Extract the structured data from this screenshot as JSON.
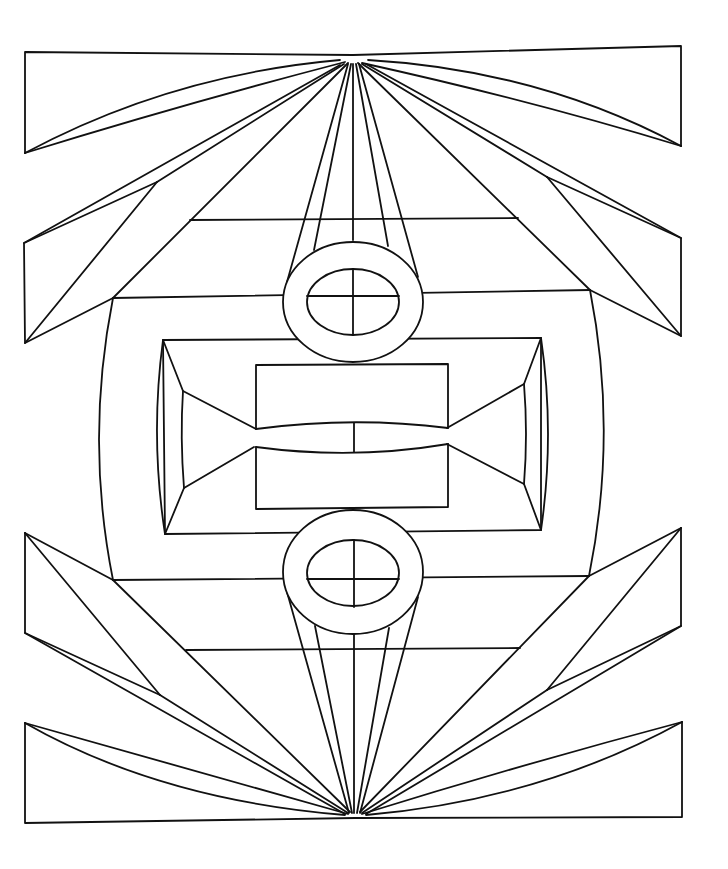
{
  "artwork": {
    "title": "",
    "stroke_color": "#111111",
    "background_color": "#ffffff",
    "width": 728,
    "height": 869,
    "apex_top": [
      353,
      55
    ],
    "apex_bottom": [
      355,
      818
    ],
    "paths": [
      {
        "name": "top-left-banner",
        "d": "M353,55 L25,52 L25,153"
      },
      {
        "name": "top-left-leaf-outer",
        "d": "M25,153 Q170,75 340,60"
      },
      {
        "name": "top-left-leaf-inner",
        "d": "M25,153 Q180,105 345,62"
      },
      {
        "name": "top-right-banner",
        "d": "M353,55 L681,46 L681,146"
      },
      {
        "name": "top-right-leaf-outer",
        "d": "M681,146 Q540,70 368,60"
      },
      {
        "name": "top-right-leaf-inner",
        "d": "M681,146 Q530,100 362,63"
      },
      {
        "name": "left-mid-bracket",
        "d": "M157,182 L24,243 L25,343 L113,298"
      },
      {
        "name": "left-mid-spoke-a",
        "d": "M24,243 L340,65"
      },
      {
        "name": "left-mid-spoke-b",
        "d": "M157,182 L344,64"
      },
      {
        "name": "left-mid-diagonal",
        "d": "M157,182 L25,343"
      },
      {
        "name": "left-mid-spoke-c",
        "d": "M113,298 L348,63"
      },
      {
        "name": "right-mid-bracket",
        "d": "M547,177 L681,238 L681,336 L590,290"
      },
      {
        "name": "right-mid-spoke-a",
        "d": "M681,238 L366,64"
      },
      {
        "name": "right-mid-spoke-b",
        "d": "M547,177 L362,64"
      },
      {
        "name": "right-mid-diagonal",
        "d": "M547,177 L681,336"
      },
      {
        "name": "right-mid-spoke-c",
        "d": "M590,290 L358,63"
      },
      {
        "name": "upper-band-line",
        "d": "M190,220 L518,218"
      },
      {
        "name": "frame-top",
        "d": "M113,298 L590,290"
      },
      {
        "name": "frame-left",
        "d": "M113,298 Q85,440 113,580"
      },
      {
        "name": "frame-right",
        "d": "M590,290 Q618,433 589,576"
      },
      {
        "name": "frame-bottom",
        "d": "M113,580 L589,576"
      },
      {
        "name": "lower-band-line",
        "d": "M186,650 L520,648"
      },
      {
        "name": "inner-tray-outer",
        "d": "M163,340 L541,338 L541,530 L165,534 Z"
      },
      {
        "name": "inner-tray-left-curve",
        "d": "M163,340 Q150,437 165,534"
      },
      {
        "name": "inner-tray-right-curve",
        "d": "M541,338 Q555,434 541,530"
      },
      {
        "name": "inner-tray-left-inner",
        "d": "M183,391 Q180,437 184,488"
      },
      {
        "name": "inner-tray-right-inner",
        "d": "M524,384 Q528,434 524,484"
      },
      {
        "name": "tray-left-bevel-top",
        "d": "M163,340 L183,391 L256,429"
      },
      {
        "name": "tray-left-bevel-bottom",
        "d": "M165,534 L184,488 L254,447"
      },
      {
        "name": "tray-right-bevel-top",
        "d": "M541,338 L524,384 L447,428"
      },
      {
        "name": "tray-right-bevel-bottom",
        "d": "M541,530 L524,484 L447,444"
      },
      {
        "name": "center-upper-box",
        "d": "M256,429 L256,365 L448,364 L448,428"
      },
      {
        "name": "center-upper-curve",
        "d": "M256,429 Q353,416 448,428"
      },
      {
        "name": "center-lower-box",
        "d": "M256,447 L256,509 L448,507 L448,444"
      },
      {
        "name": "center-lower-curve",
        "d": "M256,447 Q353,460 448,444"
      },
      {
        "name": "center-vertical-split",
        "d": "M354,423 L354,452"
      },
      {
        "name": "top-ring-left-strap-outer",
        "d": "M287,282 L348,64"
      },
      {
        "name": "top-ring-left-strap-inner",
        "d": "M314,250 L351,64"
      },
      {
        "name": "top-ring-right-strap-outer",
        "d": "M418,277 L359,64"
      },
      {
        "name": "top-ring-right-strap-inner",
        "d": "M388,246 L356,64"
      },
      {
        "name": "top-vertical-axis",
        "d": "M353,64 L353,240"
      },
      {
        "name": "bottom-ring-left-strap-outer",
        "d": "M287,592 L349,813"
      },
      {
        "name": "bottom-ring-left-strap-inner",
        "d": "M315,626 L352,813"
      },
      {
        "name": "bottom-ring-right-strap-outer",
        "d": "M418,597 L360,813"
      },
      {
        "name": "bottom-ring-right-strap-inner",
        "d": "M389,628 L357,813"
      },
      {
        "name": "bottom-vertical-axis",
        "d": "M354,634 L354,813"
      },
      {
        "name": "top-ring-crosshair-h",
        "d": "M307,296 L399,296"
      },
      {
        "name": "top-ring-crosshair-v",
        "d": "M353,269 L353,335"
      },
      {
        "name": "bottom-ring-crosshair-h",
        "d": "M307,579 L399,579"
      },
      {
        "name": "bottom-ring-crosshair-v",
        "d": "M354,540 L354,607"
      },
      {
        "name": "left-low-bracket",
        "d": "M25,533 L25,633 L160,695"
      },
      {
        "name": "left-low-edge-top",
        "d": "M25,533 L113,580"
      },
      {
        "name": "left-low-diagonal",
        "d": "M25,533 L160,695"
      },
      {
        "name": "left-low-spoke-a",
        "d": "M113,580 L350,812"
      },
      {
        "name": "left-low-spoke-b",
        "d": "M160,695 L348,813"
      },
      {
        "name": "left-low-spoke-c",
        "d": "M25,633 L345,814"
      },
      {
        "name": "right-low-bracket",
        "d": "M681,528 L681,626 L547,690"
      },
      {
        "name": "right-low-edge-top",
        "d": "M681,528 L589,576"
      },
      {
        "name": "right-low-diagonal",
        "d": "M681,528 L547,690"
      },
      {
        "name": "right-low-spoke-a",
        "d": "M589,576 L360,812"
      },
      {
        "name": "right-low-spoke-b",
        "d": "M547,690 L362,813"
      },
      {
        "name": "right-low-spoke-c",
        "d": "M681,626 L366,814"
      },
      {
        "name": "bottom-left-banner",
        "d": "M25,723 L25,823 L355,818"
      },
      {
        "name": "bottom-left-leaf-outer",
        "d": "M25,723 Q160,800 345,815"
      },
      {
        "name": "bottom-left-leaf-inner",
        "d": "M25,723 Q190,770 348,814"
      },
      {
        "name": "bottom-right-banner",
        "d": "M682,722 L682,817 L355,818"
      },
      {
        "name": "bottom-right-leaf-outer",
        "d": "M682,722 Q540,800 366,815"
      },
      {
        "name": "bottom-right-leaf-inner",
        "d": "M682,722 Q520,765 362,814"
      }
    ],
    "ellipses": [
      {
        "name": "top-ring-outer",
        "cx": 353,
        "cy": 302,
        "rx": 70,
        "ry": 60
      },
      {
        "name": "top-ring-inner",
        "cx": 353,
        "cy": 302,
        "rx": 46,
        "ry": 33
      },
      {
        "name": "bottom-ring-outer",
        "cx": 353,
        "cy": 572,
        "rx": 70,
        "ry": 62
      },
      {
        "name": "bottom-ring-inner",
        "cx": 353,
        "cy": 573,
        "rx": 46,
        "ry": 33
      }
    ]
  }
}
